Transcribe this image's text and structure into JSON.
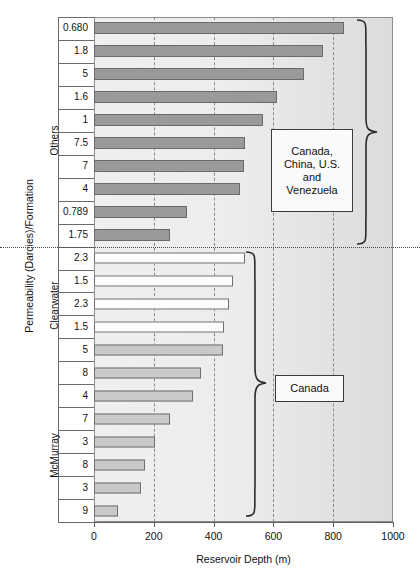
{
  "axes": {
    "y_title": "Permeability (Darcies)/Formation",
    "x_title": "Reservoir Depth (m)",
    "x_ticks": [
      "0",
      "200",
      "400",
      "600",
      "800",
      "1000"
    ],
    "x_min": 0,
    "x_max": 1000
  },
  "groups": [
    {
      "name": "Others",
      "label": "Others"
    },
    {
      "name": "Clearwater",
      "label": "Clearwater"
    },
    {
      "name": "McMurray",
      "label": "McMurray"
    }
  ],
  "callouts": [
    {
      "id": "callout-others",
      "text": "Canada,\nChina, U.S.\nand\nVenezuela"
    },
    {
      "id": "callout-canada",
      "text": "Canada"
    }
  ],
  "callout_others_lines": [
    "Canada,",
    "China, U.S.",
    "and",
    "Venezuela"
  ],
  "callout_canada_label": "Canada",
  "colors": {
    "others_bar": "#9a9a9a",
    "clearwater_bar": "#fdfdfd",
    "mcmurray_bar": "#c9c9c9",
    "plot_background": "#ececec",
    "gridline": "#8a8a8a",
    "axis": "#5f5f5f"
  },
  "chart_data": {
    "type": "bar",
    "orientation": "horizontal",
    "title": "",
    "xlabel": "Reservoir Depth (m)",
    "ylabel": "Permeability (Darcies)/Formation",
    "xlim": [
      0,
      1000
    ],
    "grid": true,
    "legend": false,
    "categories": [
      "0.680",
      "1.8",
      "5",
      "1.6",
      "1",
      "7.5",
      "7",
      "4",
      "0.789",
      "1.75",
      "2.3",
      "1.5",
      "2.3",
      "1.5",
      "5",
      "8",
      "4",
      "7",
      "3",
      "8",
      "3",
      "9"
    ],
    "values": [
      836,
      766,
      702,
      612,
      566,
      505,
      502,
      488,
      311,
      254,
      505,
      465,
      452,
      435,
      431,
      358,
      331,
      254,
      204,
      170,
      157,
      80
    ],
    "group_of_category": [
      "Others",
      "Others",
      "Others",
      "Others",
      "Others",
      "Others",
      "Others",
      "Others",
      "Others",
      "Others",
      "Clearwater",
      "Clearwater",
      "Clearwater",
      "Clearwater",
      "McMurray",
      "McMurray",
      "McMurray",
      "McMurray",
      "McMurray",
      "McMurray",
      "McMurray",
      "McMurray"
    ],
    "annotations": [
      {
        "text": "Canada, China, U.S. and Venezuela",
        "applies_to_group": "Others"
      },
      {
        "text": "Canada",
        "applies_to_group": "Clearwater + McMurray"
      }
    ]
  }
}
